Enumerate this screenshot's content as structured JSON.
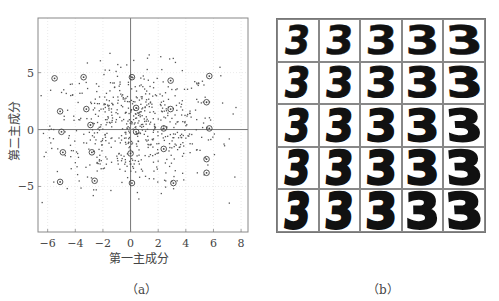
{
  "chart_data": [
    {
      "panel": "a",
      "type": "scatter",
      "title": "",
      "caption": "（a）",
      "xlabel": "第一主成分",
      "ylabel": "第二主成分",
      "xlim": [
        -6.7,
        8.5
      ],
      "ylim": [
        -9,
        9.8
      ],
      "xticks": [
        -6,
        -4,
        -2,
        0,
        2,
        4,
        6,
        8
      ],
      "xtick_labels": [
        "−6",
        "−4",
        "−2",
        "0",
        "2",
        "4",
        "6",
        "8"
      ],
      "yticks": [
        5,
        0,
        -5
      ],
      "ytick_labels": [
        "5",
        "0",
        "−5"
      ],
      "grid": "dotted vertical at x ticks, faint horizontal at y ticks",
      "reference_lines": {
        "x": 0,
        "y": 0
      },
      "legend": null,
      "series": [
        {
          "name": "samples",
          "marker": "dot",
          "description": "Several hundred digit-3 samples projected onto first two principal components; roughly elliptical cloud centered near (0,0), spanning x≈-6.5..8.3, y≈-6.5..7.3",
          "approx_count": 650
        },
        {
          "name": "selected (circled) samples",
          "marker": "circle",
          "points": [
            [
              -5.5,
              4.5
            ],
            [
              -3.4,
              4.6
            ],
            [
              0.1,
              4.6
            ],
            [
              2.9,
              4.3
            ],
            [
              5.7,
              4.7
            ],
            [
              -5.1,
              1.6
            ],
            [
              -3.2,
              1.8
            ],
            [
              0.4,
              1.9
            ],
            [
              2.9,
              1.8
            ],
            [
              5.5,
              2.4
            ],
            [
              -5.0,
              -0.2
            ],
            [
              -2.9,
              0.4
            ],
            [
              0.4,
              -0.2
            ],
            [
              2.4,
              0.1
            ],
            [
              5.7,
              0.1
            ],
            [
              -4.9,
              -2.0
            ],
            [
              -2.8,
              -2.0
            ],
            [
              0.0,
              -2.1
            ],
            [
              2.4,
              -1.7
            ],
            [
              5.5,
              -2.6
            ],
            [
              -5.1,
              -4.6
            ],
            [
              -2.6,
              -4.5
            ],
            [
              0.1,
              -4.7
            ],
            [
              3.1,
              -4.7
            ],
            [
              5.5,
              -3.8
            ]
          ]
        }
      ]
    },
    {
      "panel": "b",
      "type": "image-grid",
      "caption": "（b）",
      "rows": 5,
      "cols": 5,
      "description": "Handwritten digit '3' images corresponding to circled points in (a); left→right stroke gets wider/slanted, top→bottom strokes get thicker",
      "cells": [
        [
          "3",
          "3",
          "3",
          "3",
          "3"
        ],
        [
          "3",
          "3",
          "3",
          "3",
          "3"
        ],
        [
          "3",
          "3",
          "3",
          "3",
          "3"
        ],
        [
          "3",
          "3",
          "3",
          "3",
          "3"
        ],
        [
          "3",
          "3",
          "3",
          "3",
          "3"
        ]
      ]
    }
  ],
  "figure_a": {
    "xlabel": "第一主成分",
    "ylabel": "第二主成分",
    "caption": "（a）"
  },
  "figure_b": {
    "caption": "（b）"
  }
}
